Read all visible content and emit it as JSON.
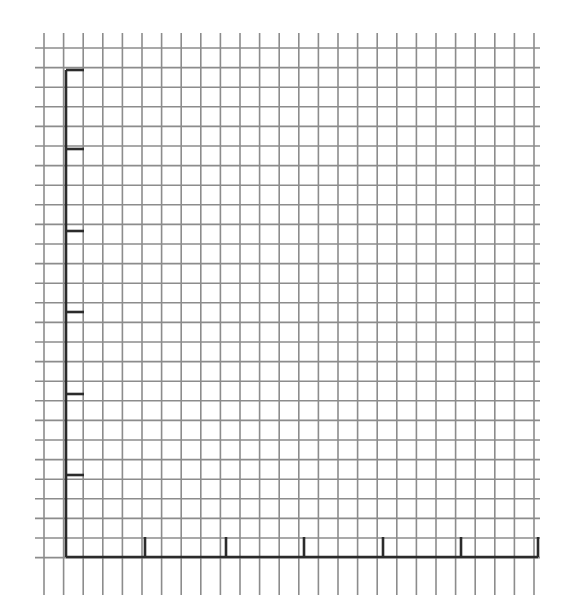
{
  "diagram": {
    "type": "blank-graph-paper-axes",
    "colors": {
      "background": "#ffffff",
      "grid_line": "#8c8c8c",
      "axis_line": "#2b2b2b"
    },
    "grid": {
      "columns": 26,
      "rows": 27,
      "cell_size_px": 19.6,
      "vertical_lines_x_start": 44,
      "vertical_lines_y_range": [
        33,
        595
      ],
      "horizontal_lines_y_start": 48,
      "horizontal_lines_x_range": [
        35,
        540
      ]
    },
    "y_axis": {
      "x": 66,
      "y_top": 70,
      "y_bottom": 557,
      "tick_positions_y": [
        70,
        149,
        231,
        312,
        394,
        475
      ],
      "tick_length_px": 18,
      "tick_labels": []
    },
    "x_axis": {
      "y": 557,
      "x_left": 66,
      "x_right": 538,
      "tick_positions_x": [
        145,
        226,
        304,
        383,
        461,
        538
      ],
      "tick_length_px": 20,
      "tick_labels": []
    }
  }
}
